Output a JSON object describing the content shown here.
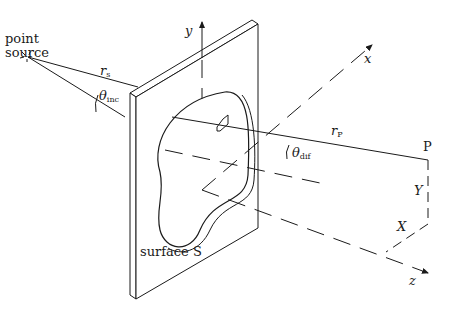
{
  "diagram": {
    "labels": {
      "point_source_line1": "point",
      "point_source_line2": "source",
      "r_s": "r",
      "r_s_sub": "s",
      "theta_inc": "θ",
      "theta_inc_sub": "inc",
      "r_p": "r",
      "r_p_sub": "P",
      "theta_dif": "θ",
      "theta_dif_sub": "dif",
      "point_p": "P",
      "big_y": "Y",
      "big_x": "X",
      "axis_x": "x",
      "axis_y": "y",
      "axis_z": "z",
      "surface": "surface S"
    },
    "colors": {
      "line": "#1a1a1a",
      "background": "#ffffff"
    }
  }
}
